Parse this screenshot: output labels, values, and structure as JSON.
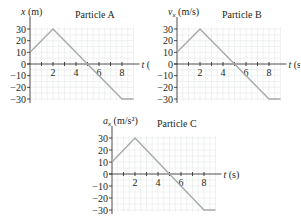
{
  "chart_data": [
    {
      "type": "line",
      "title": "Particle A",
      "ylabel": "x (m)",
      "ylabel_var": "x",
      "ylabel_sub": "",
      "ylabel_unit": " (m)",
      "xlabel": "t (s)",
      "xticks": [
        2,
        4,
        6,
        8
      ],
      "yticks": [
        30,
        20,
        10,
        0,
        -10,
        -20,
        -30
      ],
      "xlim": [
        0,
        9
      ],
      "ylim": [
        -30,
        30
      ],
      "grid": true,
      "x": [
        0,
        2,
        8,
        9
      ],
      "y": [
        10,
        30,
        -30,
        -30
      ]
    },
    {
      "type": "line",
      "title": "Particle B",
      "ylabel": "v_x (m/s)",
      "ylabel_var": "v",
      "ylabel_sub": "x",
      "ylabel_unit": " (m/s)",
      "xlabel": "t (s)",
      "xticks": [
        2,
        4,
        6,
        8
      ],
      "yticks": [
        30,
        20,
        10,
        0,
        -10,
        -20,
        -30
      ],
      "xlim": [
        0,
        9
      ],
      "ylim": [
        -30,
        30
      ],
      "grid": true,
      "x": [
        0,
        2,
        8,
        9
      ],
      "y": [
        10,
        30,
        -30,
        -30
      ]
    },
    {
      "type": "line",
      "title": "Particle C",
      "ylabel": "a_x (m/s²)",
      "ylabel_var": "a",
      "ylabel_sub": "x",
      "ylabel_unit": " (m/s²)",
      "xlabel": "t (s)",
      "xticks": [
        2,
        4,
        6,
        8
      ],
      "yticks": [
        30,
        20,
        10,
        0,
        -10,
        -20,
        -30
      ],
      "xlim": [
        0,
        9
      ],
      "ylim": [
        -30,
        30
      ],
      "grid": true,
      "x": [
        0,
        2,
        8,
        9
      ],
      "y": [
        10,
        30,
        -30,
        -30
      ]
    }
  ],
  "colors": {
    "line": "#a7a9ac",
    "axis": "#231f20",
    "grid": "#e6e7e8"
  }
}
